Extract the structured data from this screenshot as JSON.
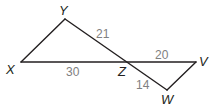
{
  "diagram": {
    "type": "geometry-two-triangles",
    "points": {
      "X": {
        "label": "X",
        "x": 21,
        "y": 62
      },
      "Y": {
        "label": "Y",
        "x": 65,
        "y": 19
      },
      "Z": {
        "label": "Z",
        "x": 127,
        "y": 62
      },
      "V": {
        "label": "V",
        "x": 196,
        "y": 62
      },
      "W": {
        "label": "W",
        "x": 167,
        "y": 90
      }
    },
    "segments": [
      {
        "from": "X",
        "to": "Y"
      },
      {
        "from": "Y",
        "to": "W"
      },
      {
        "from": "X",
        "to": "V"
      },
      {
        "from": "V",
        "to": "W"
      }
    ],
    "lengths": {
      "YZ": "21",
      "XZ": "30",
      "ZV": "20",
      "ZW": "14"
    },
    "colors": {
      "line": "#231f20",
      "length_text": "#808080"
    }
  }
}
